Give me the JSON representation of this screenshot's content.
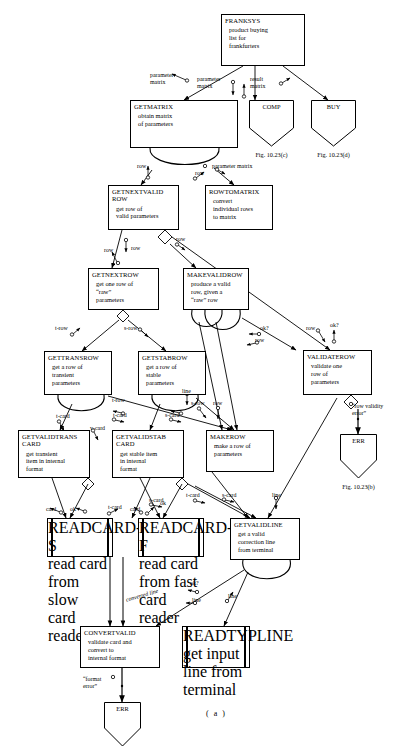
{
  "diagram": {
    "caption": "( a )",
    "type": "structure-chart",
    "modules": [
      {
        "id": "franksys",
        "name": "FRANKSYS",
        "desc": [
          "product buying",
          "list for",
          "frankfurters"
        ],
        "x": 221,
        "y": 14,
        "w": 84,
        "h": 52,
        "shape": "rect"
      },
      {
        "id": "getmatrix",
        "name": "GETMATRIX",
        "desc": [
          "obtain matrix",
          "of parameters"
        ],
        "x": 130,
        "y": 100,
        "w": 108,
        "h": 48,
        "shape": "rect"
      },
      {
        "id": "comp",
        "name": "COMP",
        "desc": [],
        "x": 249,
        "y": 100,
        "w": 45,
        "h": 34,
        "shape": "err",
        "fig": "Fig. 10.23(c)"
      },
      {
        "id": "buy",
        "name": "BUY",
        "desc": [],
        "x": 311,
        "y": 100,
        "w": 45,
        "h": 34,
        "shape": "err",
        "fig": "Fig. 10.23(d)"
      },
      {
        "id": "getnextvalidrow",
        "name": "GETNEXTVALID ROW",
        "desc": [
          "get row of",
          "valid parameters"
        ],
        "x": 108,
        "y": 185,
        "w": 71,
        "h": 45,
        "shape": "rect"
      },
      {
        "id": "rowtomatrix",
        "name": "ROWTOMATRIX",
        "desc": [
          "convert",
          "individual rows",
          "to matrix"
        ],
        "x": 205,
        "y": 185,
        "w": 68,
        "h": 45,
        "shape": "rect"
      },
      {
        "id": "getnextrow",
        "name": "GETNEXTROW",
        "desc": [
          "get one row of",
          "“raw”",
          "parameters"
        ],
        "x": 88,
        "y": 268,
        "w": 71,
        "h": 42,
        "shape": "rect"
      },
      {
        "id": "makevalidrow",
        "name": "MAKEVALIDROW",
        "desc": [
          "produce a valid",
          "row, given a",
          "“raw” row"
        ],
        "x": 183,
        "y": 268,
        "w": 66,
        "h": 42,
        "shape": "rect"
      },
      {
        "id": "validaterow",
        "name": "VALIDATEROW",
        "desc": [
          "validate one",
          "row of",
          "parameters"
        ],
        "x": 303,
        "y": 350,
        "w": 69,
        "h": 45,
        "shape": "rect"
      },
      {
        "id": "gettransrow",
        "name": "GETTRANSROW",
        "desc": [
          "get a row of",
          "transient",
          "parameters"
        ],
        "x": 44,
        "y": 351,
        "w": 68,
        "h": 44,
        "shape": "rect"
      },
      {
        "id": "getstabrow",
        "name": "GETSTABROW",
        "desc": [
          "get a row of",
          "stable",
          "parameters"
        ],
        "x": 138,
        "y": 351,
        "w": 68,
        "h": 44,
        "shape": "rect"
      },
      {
        "id": "getvalidtranscard",
        "name": "GETVALIDTRANS CARD",
        "desc": [
          "get transient",
          "item in internal",
          "format"
        ],
        "x": 18,
        "y": 430,
        "w": 72,
        "h": 48,
        "shape": "rect"
      },
      {
        "id": "getvalidstabcard",
        "name": "GETVALIDSTAB CARD",
        "desc": [
          "get stable item",
          "in internal",
          "format"
        ],
        "x": 112,
        "y": 430,
        "w": 72,
        "h": 48,
        "shape": "rect"
      },
      {
        "id": "makerow",
        "name": "MAKEROW",
        "desc": [
          "make a row of",
          "parameters"
        ],
        "x": 206,
        "y": 430,
        "w": 68,
        "h": 42,
        "shape": "rect"
      },
      {
        "id": "readcards",
        "name": "READCARD-S",
        "desc": [
          "read card",
          "from slow",
          "card reader"
        ],
        "x": 47,
        "y": 518,
        "w": 66,
        "h": 39,
        "shape": "device"
      },
      {
        "id": "readcardf",
        "name": "READCARD-F",
        "desc": [
          "read card",
          "from fast",
          "card reader"
        ],
        "x": 138,
        "y": 518,
        "w": 66,
        "h": 39,
        "shape": "device"
      },
      {
        "id": "getvalidline",
        "name": "GETVALIDLINE",
        "desc": [
          "get a valid",
          "correction line",
          "from terminal"
        ],
        "x": 230,
        "y": 518,
        "w": 70,
        "h": 42,
        "shape": "rect"
      },
      {
        "id": "convertvalid",
        "name": "CONVERTVALID",
        "desc": [
          "validate card and",
          "convert to",
          "internal format"
        ],
        "x": 80,
        "y": 626,
        "w": 80,
        "h": 42,
        "shape": "rect"
      },
      {
        "id": "readtypline",
        "name": "READTYPLINE",
        "desc": [
          "get input",
          "line from",
          "terminal"
        ],
        "x": 182,
        "y": 626,
        "w": 68,
        "h": 42,
        "shape": "device"
      },
      {
        "id": "err_row",
        "name": "ERR",
        "desc": [],
        "x": 340,
        "y": 434,
        "w": 37,
        "h": 32,
        "shape": "err",
        "fig": "Fig. 10.23(b)"
      },
      {
        "id": "err_fmt",
        "name": "ERR",
        "desc": [],
        "x": 104,
        "y": 702,
        "w": 37,
        "h": 32,
        "shape": "err",
        "fig": ""
      }
    ],
    "data_labels": [
      {
        "id": "l-parammatrix-1",
        "text": "parameter\nmatrix",
        "x": 150,
        "y": 72
      },
      {
        "id": "l-parammatrix-2",
        "text": "parameter\nmatrix",
        "x": 197,
        "y": 76
      },
      {
        "id": "l-resultmatrix",
        "text": "result\nmatrix",
        "x": 250,
        "y": 76
      },
      {
        "id": "l-row-gm-1",
        "text": "row",
        "x": 137,
        "y": 163
      },
      {
        "id": "l-row-gm-2",
        "text": "row",
        "x": 195,
        "y": 170
      },
      {
        "id": "l-parammatrix-3",
        "text": "parameter matrix",
        "x": 212,
        "y": 163
      },
      {
        "id": "l-row-gnv-1",
        "text": "row",
        "x": 104,
        "y": 247
      },
      {
        "id": "l-row-gnv-2",
        "text": "row",
        "x": 131,
        "y": 245
      },
      {
        "id": "l-row-gnv-3",
        "text": "row",
        "x": 176,
        "y": 236
      },
      {
        "id": "l-trow",
        "text": "t-row",
        "x": 55,
        "y": 325
      },
      {
        "id": "l-srow",
        "text": "s-row",
        "x": 124,
        "y": 325
      },
      {
        "id": "l-ok-mvr",
        "text": "ok?",
        "x": 260,
        "y": 325
      },
      {
        "id": "l-row-mvr",
        "text": "row",
        "x": 255,
        "y": 337
      },
      {
        "id": "l-row-vr",
        "text": "row",
        "x": 306,
        "y": 325
      },
      {
        "id": "l-ok-vr",
        "text": "ok?",
        "x": 330,
        "y": 322
      },
      {
        "id": "l-trow-2",
        "text": "t-row",
        "x": 112,
        "y": 397
      },
      {
        "id": "l-tcard-1",
        "text": "t-card",
        "x": 56,
        "y": 413
      },
      {
        "id": "l-tcard-2",
        "text": "t-card",
        "x": 113,
        "y": 412
      },
      {
        "id": "l-scard-1",
        "text": "s-card",
        "x": 165,
        "y": 412
      },
      {
        "id": "l-srow-2",
        "text": "s-row",
        "x": 191,
        "y": 400
      },
      {
        "id": "l-row-mr",
        "text": "row",
        "x": 213,
        "y": 400
      },
      {
        "id": "l-line-mr",
        "text": "line",
        "x": 182,
        "y": 388
      },
      {
        "id": "l-vcard",
        "text": "v-card",
        "x": 90,
        "y": 425
      },
      {
        "id": "l-rowvalidity",
        "text": "“row validity\nerror”",
        "x": 352,
        "y": 403
      },
      {
        "id": "l-scard-2",
        "text": "s-card",
        "x": 149,
        "y": 497
      },
      {
        "id": "l-tcard-3",
        "text": "t-card",
        "x": 186,
        "y": 492
      },
      {
        "id": "l-scard-3",
        "text": "s-card",
        "x": 222,
        "y": 492
      },
      {
        "id": "l-line-gvl",
        "text": "line",
        "x": 272,
        "y": 492
      },
      {
        "id": "l-tcard-4",
        "text": "t-card",
        "x": 108,
        "y": 504
      },
      {
        "id": "l-ok-1",
        "text": "ok",
        "x": 70,
        "y": 506
      },
      {
        "id": "l-card-1",
        "text": "card",
        "x": 46,
        "y": 506
      },
      {
        "id": "l-ok-2",
        "text": "ok",
        "x": 160,
        "y": 500
      },
      {
        "id": "l-card-2",
        "text": "card",
        "x": 130,
        "y": 506
      },
      {
        "id": "l-ok-cv",
        "text": "ok?",
        "x": 190,
        "y": 580
      },
      {
        "id": "l-convline",
        "text": "converted line",
        "x": 125,
        "y": 597
      },
      {
        "id": "l-line-cv",
        "text": "line",
        "x": 192,
        "y": 597
      },
      {
        "id": "l-line-rt",
        "text": "line",
        "x": 228,
        "y": 593
      },
      {
        "id": "l-formaterror",
        "text": "“format\nerror”",
        "x": 83,
        "y": 676
      }
    ]
  }
}
